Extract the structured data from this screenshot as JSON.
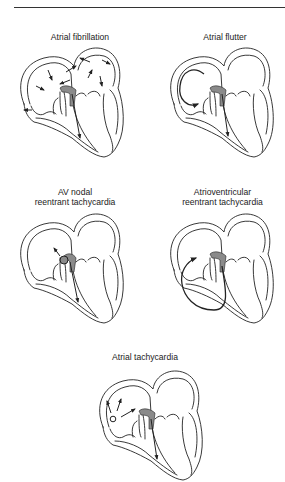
{
  "figure": {
    "panels": [
      {
        "id": "af",
        "title_lines": [
          "Atrial fibrillation"
        ],
        "mechanism": "multiple chaotic wavelets in both atria"
      },
      {
        "id": "aflutter",
        "title_lines": [
          "Atrial flutter"
        ],
        "mechanism": "macro-reentrant circuit in right atrium"
      },
      {
        "id": "avnrt",
        "title_lines": [
          "AV nodal",
          "reentrant tachycardia"
        ],
        "mechanism": "reentry within AV node"
      },
      {
        "id": "avrt",
        "title_lines": [
          "Atrioventricular",
          "reentrant tachycardia"
        ],
        "mechanism": "reentry via accessory pathway"
      },
      {
        "id": "at",
        "title_lines": [
          "Atrial tachycardia"
        ],
        "mechanism": "focal ectopic atrial source"
      }
    ]
  },
  "colors": {
    "line": "#222222",
    "node": "#8a8a8a",
    "background": "#ffffff"
  }
}
